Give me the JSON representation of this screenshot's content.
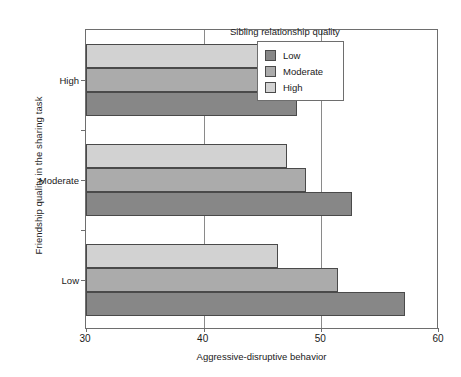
{
  "chart_data": {
    "type": "bar",
    "orientation": "horizontal",
    "title": "",
    "xlabel": "Aggressive-disruptive behavior",
    "ylabel": "Friendship quality in the sharing task",
    "xlim": [
      30,
      60
    ],
    "xticks": [
      30,
      40,
      50,
      60
    ],
    "xtick_labels": [
      "30",
      "40",
      "50",
      "60"
    ],
    "grid": true,
    "categories": [
      "High",
      "Moderate",
      "Low"
    ],
    "legend_title": "Sibling relationship quality",
    "legend_position": "top-right inside",
    "series": [
      {
        "name": "Low",
        "color": "#878787",
        "values": [
          47.9,
          52.6,
          57.1
        ]
      },
      {
        "name": "Moderate",
        "color": "#ababab",
        "values": [
          47.7,
          48.7,
          51.4
        ]
      },
      {
        "name": "High",
        "color": "#d2d2d2",
        "values": [
          47.4,
          47.1,
          46.3
        ]
      }
    ]
  },
  "axis": {
    "xlabel": "Aggressive-disruptive behavior",
    "ylabel": "Friendship quality in the sharing task",
    "xticks": [
      {
        "label": "30"
      },
      {
        "label": "40"
      },
      {
        "label": "50"
      },
      {
        "label": "60"
      }
    ],
    "categories": [
      {
        "label": "High"
      },
      {
        "label": "Moderate"
      },
      {
        "label": "Low"
      }
    ]
  },
  "legend": {
    "title": "Sibling relationship quality",
    "items": [
      {
        "label": "Low",
        "color": "#878787"
      },
      {
        "label": "Moderate",
        "color": "#ababab"
      },
      {
        "label": "High",
        "color": "#d2d2d2"
      }
    ]
  }
}
